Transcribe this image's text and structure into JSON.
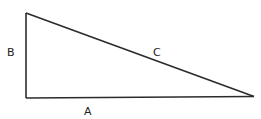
{
  "diagram": {
    "shape": "right-triangle",
    "vertices": {
      "top_left": [
        26,
        13
      ],
      "bottom_left": [
        26,
        98
      ],
      "right": [
        254,
        96
      ]
    },
    "stroke_color": "#2b2b2b",
    "labels": {
      "side_a": "A",
      "side_b": "B",
      "side_c": "C"
    }
  }
}
